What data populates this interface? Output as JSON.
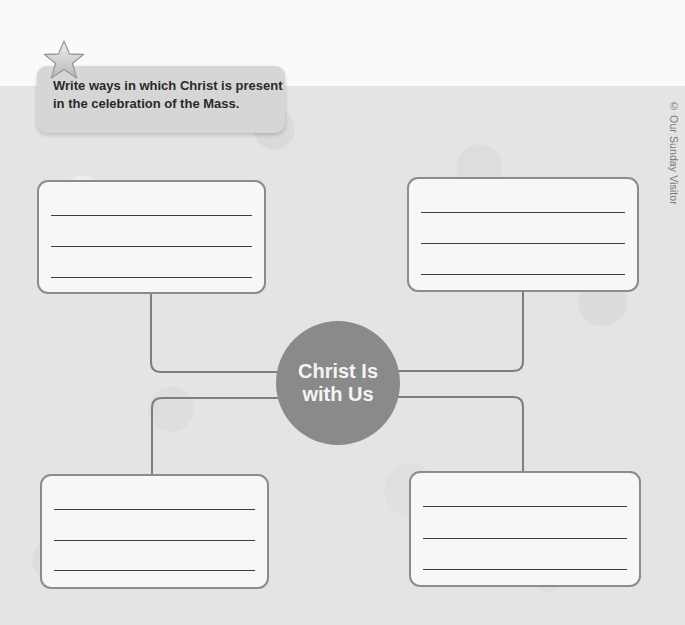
{
  "instruction": {
    "icon": "star-icon",
    "text": "Write ways in which Christ is present in the celebration of the Mass."
  },
  "copyright": "© Our Sunday Visitor",
  "web": {
    "center_label": "Christ Is with Us",
    "center_label_line1": "Christ Is",
    "center_label_line2": "with Us",
    "center_color": "#8a8a8a",
    "boxes": [
      {
        "position": "top-left",
        "lines": 3,
        "value": ""
      },
      {
        "position": "top-right",
        "lines": 3,
        "value": ""
      },
      {
        "position": "bottom-left",
        "lines": 3,
        "value": ""
      },
      {
        "position": "bottom-right",
        "lines": 3,
        "value": ""
      }
    ]
  }
}
